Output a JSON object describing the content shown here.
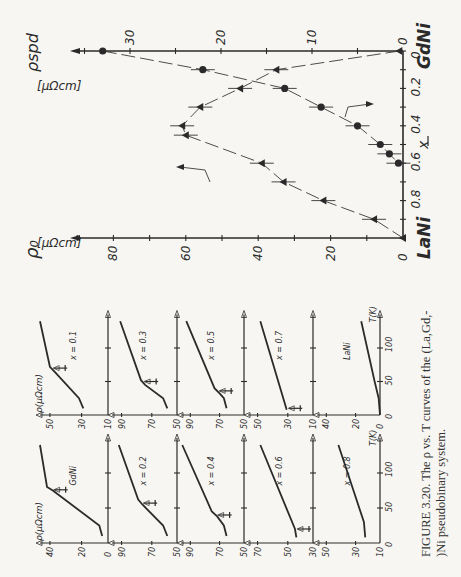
{
  "caption": {
    "line1": "FIGURE 3.20.    The ρ vs. T curves of the (La,Gd,-",
    "line2": ")Ni pseudobinary system."
  },
  "main_plot": {
    "left_axis_label": "ρ₀",
    "left_axis_unit": "[μΩcm]",
    "right_axis_label": "ρspd",
    "right_axis_unit": "[μΩcm]",
    "left_endpoint": "LaNi",
    "right_endpoint": "GdNi",
    "x_label": "x",
    "x_arrow": "←",
    "x_ticks": [
      "0",
      "0.2",
      "0.4",
      "0.6",
      "0.8"
    ],
    "x_tick_values": [
      0,
      0.2,
      0.4,
      0.6,
      0.8
    ],
    "left_ticks": [
      "0",
      "20",
      "40",
      "60",
      "80"
    ],
    "left_tick_values": [
      0,
      20,
      40,
      60,
      80
    ],
    "right_ticks": [
      "0",
      "10",
      "20",
      "30"
    ],
    "right_tick_values": [
      0,
      10,
      20,
      30
    ]
  },
  "panels": {
    "y_label": "ρ(μΩcm)",
    "t_label": "T(K)",
    "t_ticks": [
      "0",
      "50",
      "100"
    ],
    "items": [
      {
        "label": "GdNi",
        "col": "A",
        "row": 0,
        "ticks": [
          "0",
          "20",
          "40"
        ]
      },
      {
        "label": "x = 0.1",
        "col": "B",
        "row": 0,
        "ticks": [
          "10",
          "30",
          "50"
        ]
      },
      {
        "label": "x = 0.2",
        "col": "A",
        "row": 1,
        "ticks": [
          "50",
          "70",
          "90"
        ]
      },
      {
        "label": "x = 0.3",
        "col": "B",
        "row": 1,
        "ticks": [
          "50",
          "70",
          "90"
        ]
      },
      {
        "label": "x = 0.4",
        "col": "A",
        "row": 2,
        "ticks": [
          "50",
          "70",
          "90"
        ]
      },
      {
        "label": "x = 0.5",
        "col": "B",
        "row": 2,
        "ticks": [
          "50",
          "70",
          "90"
        ]
      },
      {
        "label": "x = 0.6",
        "col": "A",
        "row": 3,
        "ticks": [
          "30",
          "50",
          "70"
        ]
      },
      {
        "label": "x = 0.7",
        "col": "B",
        "row": 3,
        "ticks": [
          "10",
          "30",
          "50"
        ]
      },
      {
        "label": "x = 0.8",
        "col": "A",
        "row": 4,
        "ticks": [
          "10",
          "30",
          "50"
        ]
      },
      {
        "label": "LaNi",
        "col": "B",
        "row": 4,
        "ticks": [
          "0",
          "20",
          "40"
        ]
      }
    ]
  },
  "chart_data": [
    {
      "type": "scatter",
      "title": "ρ0 and ρspd vs composition x in (La1-xGdx)Ni",
      "xlabel": "x (LaNi ← → GdNi)",
      "ylabel_left": "ρ0 [μΩcm]",
      "ylabel_right": "ρspd [μΩcm]",
      "x_range": [
        0,
        1
      ],
      "ylim_left": [
        0,
        90
      ],
      "ylim_right": [
        0,
        35
      ],
      "series": [
        {
          "name": "ρ0 (triangles, left axis)",
          "marker": "triangle",
          "x": [
            0,
            0.1,
            0.2,
            0.3,
            0.4,
            0.45,
            0.6,
            0.7,
            0.8,
            0.9,
            1.0
          ],
          "values": [
            1,
            35,
            45,
            56,
            61,
            60,
            39,
            33,
            22,
            8,
            0
          ]
        },
        {
          "name": "ρspd (circles, right axis)",
          "marker": "circle",
          "x": [
            0,
            0.1,
            0.2,
            0.3,
            0.4,
            0.5,
            0.55,
            0.6
          ],
          "values": [
            33,
            22,
            13,
            9,
            5,
            2.5,
            1.5,
            0.5
          ]
        }
      ],
      "grid": false
    },
    {
      "type": "line",
      "title": "ρ vs T panels",
      "xlabel": "T(K)",
      "ylabel": "ρ(μΩcm)",
      "x_ticks": [
        0,
        50,
        100
      ],
      "series": [
        {
          "name": "GdNi",
          "T": [
            10,
            25,
            75,
            80,
            140
          ],
          "values": [
            4,
            6,
            38,
            42,
            52
          ],
          "kink_T": 76
        },
        {
          "name": "x = 0.1",
          "T": [
            10,
            25,
            65,
            72,
            140
          ],
          "values": [
            27,
            30,
            47,
            50,
            60
          ],
          "kink_T": 70
        },
        {
          "name": "x = 0.2",
          "T": [
            10,
            25,
            55,
            62,
            140
          ],
          "values": [
            57,
            60,
            75,
            78,
            92
          ],
          "kink_T": 57
        },
        {
          "name": "x = 0.3",
          "T": [
            10,
            25,
            45,
            52,
            140
          ],
          "values": [
            57,
            60,
            73,
            76,
            91
          ],
          "kink_T": 50
        },
        {
          "name": "x = 0.4",
          "T": [
            10,
            25,
            38,
            45,
            140
          ],
          "values": [
            63,
            65,
            70,
            74,
            96
          ],
          "kink_T": 40
        },
        {
          "name": "x = 0.5",
          "T": [
            10,
            25,
            32,
            40,
            140
          ],
          "values": [
            63,
            65,
            68,
            72,
            93
          ],
          "kink_T": 36
        },
        {
          "name": "x = 0.6",
          "T": [
            8,
            20,
            140
          ],
          "values": [
            42,
            43,
            68
          ],
          "kink_T": 20
        },
        {
          "name": "x = 0.7",
          "T": [
            8,
            15,
            140
          ],
          "values": [
            29,
            30,
            48
          ],
          "kink_T": 10
        },
        {
          "name": "x = 0.8",
          "T": [
            8,
            30,
            140
          ],
          "values": [
            21,
            22,
            41
          ]
        },
        {
          "name": "LaNi",
          "T": [
            0,
            25,
            50,
            140
          ],
          "values": [
            0,
            1,
            4,
            14
          ]
        }
      ]
    }
  ]
}
